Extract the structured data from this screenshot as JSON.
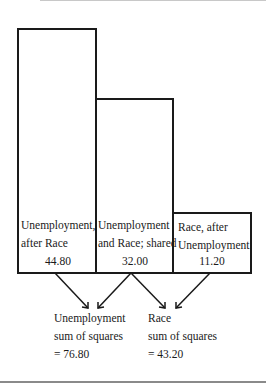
{
  "diagram": {
    "boxes": [
      {
        "line1": "Unemployment,",
        "line2": "after Race",
        "value": "44.80"
      },
      {
        "line1": "Unemployment",
        "line2": "and Race; shared",
        "value": "32.00"
      },
      {
        "line1": "Race, after",
        "line2": "Unemployment",
        "value": "11.20"
      }
    ],
    "results": [
      {
        "line1": "Unemployment",
        "line2": "sum of squares",
        "line3": "= 76.80"
      },
      {
        "line1": "Race",
        "line2": "sum of squares",
        "line3": "= 43.20"
      }
    ]
  }
}
